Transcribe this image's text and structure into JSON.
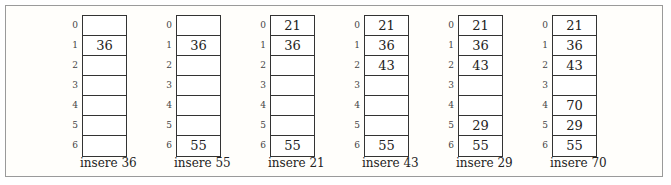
{
  "diagram": {
    "index_labels": [
      "0",
      "1",
      "2",
      "3",
      "4",
      "5",
      "6"
    ],
    "steps": [
      {
        "caption": "insere 36",
        "cells": [
          "",
          "36",
          "",
          "",
          "",
          "",
          ""
        ]
      },
      {
        "caption": "insere 55",
        "cells": [
          "",
          "36",
          "",
          "",
          "",
          "",
          "55"
        ]
      },
      {
        "caption": "insere 21",
        "cells": [
          "21",
          "36",
          "",
          "",
          "",
          "",
          "55"
        ]
      },
      {
        "caption": "insere 43",
        "cells": [
          "21",
          "36",
          "43",
          "",
          "",
          "",
          "55"
        ]
      },
      {
        "caption": "insere 29",
        "cells": [
          "21",
          "36",
          "43",
          "",
          "",
          "29",
          "55"
        ]
      },
      {
        "caption": "insere 70",
        "cells": [
          "21",
          "36",
          "43",
          "",
          "70",
          "29",
          "55"
        ]
      }
    ]
  }
}
